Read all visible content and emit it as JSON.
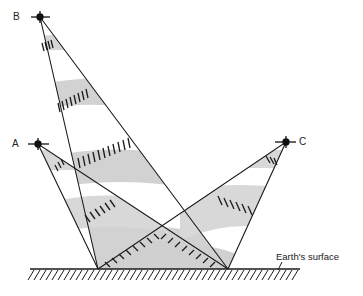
{
  "diagram": {
    "satellites": [
      {
        "label": "B",
        "x": 40,
        "y": 17,
        "label_x": 13,
        "label_y": 11
      },
      {
        "label": "A",
        "x": 38,
        "y": 144,
        "label_x": 12,
        "label_y": 139
      },
      {
        "label": "C",
        "x": 286,
        "y": 142,
        "label_x": 299,
        "label_y": 137
      }
    ],
    "ground_label": "Earth's surface",
    "footprint": {
      "left_x": 98,
      "right_x": 228,
      "y": 269
    },
    "colors": {
      "line": "#1a1a1a",
      "band": "#d9d9d9",
      "background": "#ffffff"
    }
  }
}
